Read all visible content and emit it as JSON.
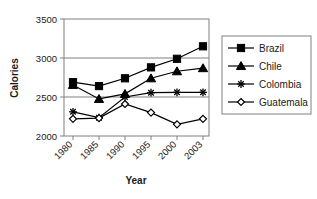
{
  "chart_data": {
    "type": "line",
    "title": "",
    "xlabel": "Year",
    "ylabel": "Calories",
    "categories": [
      "1980",
      "1985",
      "1990",
      "1995",
      "2000",
      "2003"
    ],
    "series": [
      {
        "name": "Brazil",
        "marker": "filled-square",
        "values": [
          2690,
          2640,
          2740,
          2880,
          2990,
          3150
        ]
      },
      {
        "name": "Chile",
        "marker": "filled-triangle",
        "values": [
          2655,
          2475,
          2540,
          2740,
          2830,
          2870
        ]
      },
      {
        "name": "Colombia",
        "marker": "asterisk",
        "values": [
          2310,
          2235,
          2500,
          2555,
          2560,
          2560
        ]
      },
      {
        "name": "Guatemala",
        "marker": "open-diamond",
        "values": [
          2220,
          2230,
          2410,
          2300,
          2150,
          2220
        ]
      }
    ],
    "ylim": [
      2000,
      3500
    ],
    "yticks": [
      2000,
      2500,
      3000,
      3500
    ],
    "ytick_labels": [
      "2000",
      "2500",
      "3000",
      "3500"
    ],
    "grid": "horizontal",
    "legend_position": "right",
    "xtick_rotation": 45,
    "colors": {
      "line": "#000000",
      "grid": "#808080",
      "axis": "#808080",
      "text": "#1a1a1a"
    }
  },
  "legend": {
    "items": [
      {
        "label": "Brazil"
      },
      {
        "label": "Chile"
      },
      {
        "label": "Colombia"
      },
      {
        "label": "Guatemala"
      }
    ]
  },
  "axes": {
    "y_title": "Calories",
    "x_title": "Year",
    "y_tick_0": "2000",
    "y_tick_1": "2500",
    "y_tick_2": "3000",
    "y_tick_3": "3500",
    "x_tick_0": "1980",
    "x_tick_1": "1985",
    "x_tick_2": "1990",
    "x_tick_3": "1995",
    "x_tick_4": "2000",
    "x_tick_5": "2003"
  }
}
